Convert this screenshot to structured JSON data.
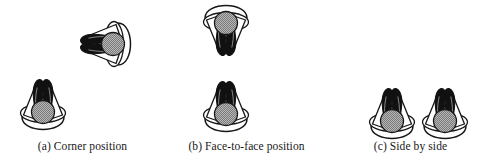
{
  "figure": {
    "type": "illustration",
    "background_color": "#ffffff",
    "ink_color": "#171717",
    "head_fill_color": "#9e9e9e",
    "panels": [
      {
        "id": "a",
        "caption": "(a) Corner position",
        "seat_count": 2,
        "seats": [
          {
            "name": "seat-upper-right",
            "rotation_deg": -90
          },
          {
            "name": "seat-lower-left",
            "rotation_deg": 0
          }
        ]
      },
      {
        "id": "b",
        "caption": "(b) Face-to-face position",
        "seat_count": 2,
        "seats": [
          {
            "name": "seat-upper",
            "rotation_deg": 180
          },
          {
            "name": "seat-lower",
            "rotation_deg": 0
          }
        ]
      },
      {
        "id": "c",
        "caption": "(c) Side by side",
        "seat_count": 2,
        "seats": [
          {
            "name": "seat-left",
            "rotation_deg": 0
          },
          {
            "name": "seat-right",
            "rotation_deg": 0
          }
        ]
      }
    ]
  },
  "captions": {
    "a": "(a) Corner position",
    "b": "(b) Face-to-face position",
    "c": "(c) Side by side"
  }
}
